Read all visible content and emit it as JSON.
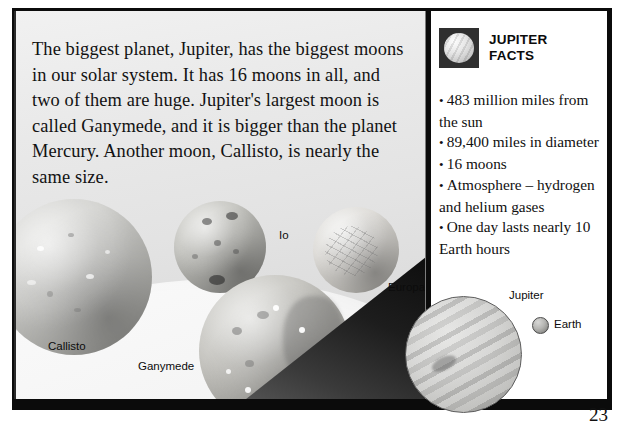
{
  "page": {
    "cropped_title": "Jupiter's biggest moons",
    "page_number": "23"
  },
  "intro": {
    "paragraph": "The biggest planet, Jupiter, has the biggest moons in our solar system. It has 16 moons in all, and two of them are huge. Jupiter's largest moon is called Ganymede, and it is bigger than the planet Mercury. Another moon, Callisto, is nearly the same size."
  },
  "facts": {
    "title_line1": "JUPITER",
    "title_line2": "FACTS",
    "icon": "jupiter-planet-icon",
    "items": [
      "483 million miles from the sun",
      "89,400 miles in diameter",
      "16 moons",
      "Atmosphere – hydrogen and helium gases",
      "One day lasts nearly 10 Earth hours"
    ]
  },
  "moons": [
    {
      "name": "Io"
    },
    {
      "name": "Europa"
    },
    {
      "name": "Callisto"
    },
    {
      "name": "Ganymede"
    }
  ],
  "comparison": {
    "jupiter_label": "Jupiter",
    "earth_label": "Earth"
  },
  "colors": {
    "frame": "#0b0b0b",
    "panel": "#e6e6e6",
    "facts_box": "#ffffff",
    "text": "#111111"
  }
}
